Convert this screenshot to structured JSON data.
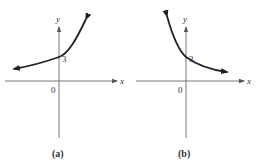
{
  "panels": [
    {
      "id": "a",
      "caption": "(a)",
      "x_axis_label": "x",
      "y_axis_label": "y",
      "origin_label": "0",
      "intercept_label": "3",
      "curve": "increasing exponential (growth)"
    },
    {
      "id": "b",
      "caption": "(b)",
      "x_axis_label": "x",
      "y_axis_label": "y",
      "origin_label": "0",
      "intercept_label": "3",
      "curve": "decreasing exponential (decay)"
    }
  ],
  "colors": {
    "axis": "#555555",
    "curve": "#222222",
    "text": "#333333"
  }
}
